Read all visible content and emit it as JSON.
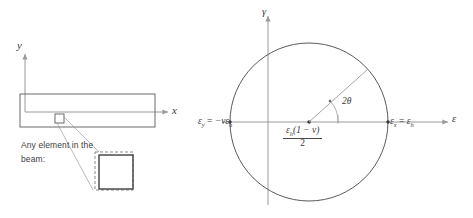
{
  "figure": {
    "line_color": "#5a5a5a",
    "axis_color": "#9a9a9a",
    "text_color": "#3a3a3a",
    "background": "#ffffff"
  },
  "beam_diagram": {
    "y_axis_label": "y",
    "x_axis_label": "x",
    "callout_line1": "Any element in the",
    "callout_line2": "beam:",
    "element_marker_name": "element-square",
    "enlarged_element": {
      "original_shape": "solid-square",
      "deformed_shape": "dashed-square"
    }
  },
  "mohr_circle": {
    "vertical_axis_label": "γ",
    "horizontal_axis_label": "ε",
    "left_point_label": {
      "symbol": "ε",
      "subscript": "y",
      "equals": "=",
      "value": "−νε",
      "value_subscript": "h",
      "full": "ε_y = −νε_h"
    },
    "right_point_label": {
      "symbol": "ε",
      "subscript": "x",
      "equals": "=",
      "value": "ε",
      "value_subscript": "h",
      "full": "ε_x = ε_h"
    },
    "center_label": {
      "numerator_a": "ε",
      "numerator_a_sub": "h",
      "numerator_b": "(1 − ν)",
      "denominator": "2",
      "full": "ε_h(1 − ν) / 2"
    },
    "angle_label": "2θ",
    "geometry": {
      "center_x": 309,
      "center_y": 122,
      "radius": 79,
      "radius_line_angle_deg": 42
    }
  }
}
